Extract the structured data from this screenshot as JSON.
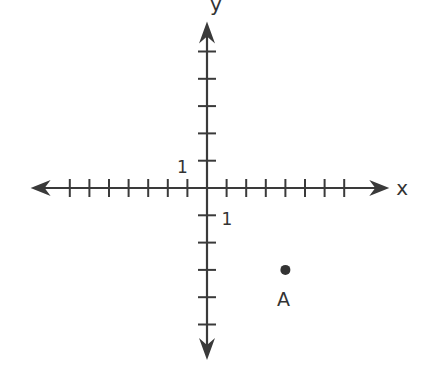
{
  "chart_data": {
    "type": "scatter",
    "title": "",
    "xlabel": "x",
    "ylabel": "y",
    "x_tick_count_negative": 7,
    "x_tick_count_positive": 7,
    "y_tick_count_positive": 5,
    "y_tick_count_negative": 5,
    "xlim": [
      -9,
      9.3
    ],
    "ylim": [
      -6.3,
      6.1
    ],
    "unit_labels": {
      "x_unit": "1",
      "y_unit": "1"
    },
    "grid": false,
    "points": [
      {
        "label": "A",
        "x": 4,
        "y": -3
      }
    ]
  },
  "colors": {
    "ink": "#3a3a3a",
    "background": "#ffffff"
  }
}
